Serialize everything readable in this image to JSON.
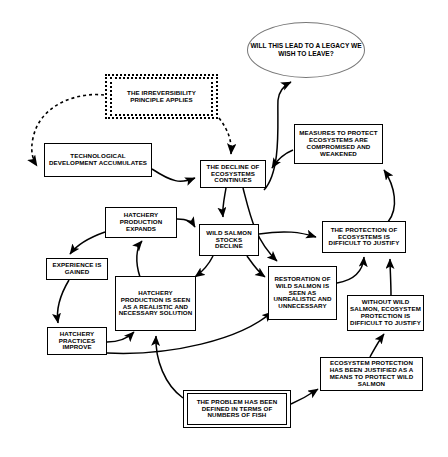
{
  "diagram": {
    "nodes": [
      {
        "id": "legacy",
        "label": "WILL THIS LEAD TO A LEGACY WE WISH TO LEAVE?",
        "shape": "ellipse"
      },
      {
        "id": "irreversibility",
        "label": "THE IRREVERSIBILITY PRINCIPLE APPLIES",
        "shape": "dashed-double-rect"
      },
      {
        "id": "technological",
        "label": "TECHNOLOGICAL DEVELOPMENT ACCUMULATES",
        "shape": "rect"
      },
      {
        "id": "decline",
        "label": "THE DECLINE OF ECOSYSTEMS CONTINUES",
        "shape": "rect"
      },
      {
        "id": "measures",
        "label": "MEASURES TO PROTECT ECOSYSTEMS ARE COMPROMISED AND WEAKENED",
        "shape": "rect"
      },
      {
        "id": "hatchery-expands",
        "label": "HATCHERY PRODUCTION EXPANDS",
        "shape": "rect"
      },
      {
        "id": "wild-salmon-decline",
        "label": "WILD SALMON STOCKS DECLINE",
        "shape": "rect"
      },
      {
        "id": "protection-difficult",
        "label": "THE PROTECTION OF ECOSYSTEMS IS DIFFICULT TO JUSTIFY",
        "shape": "rect"
      },
      {
        "id": "experience",
        "label": "EXPERIENCE IS GAINED",
        "shape": "rect"
      },
      {
        "id": "hatchery-solution",
        "label": "HATCHERY PRODUCTION IS SEEN AS A REALISTIC AND NECESSARY SOLUTION",
        "shape": "rect"
      },
      {
        "id": "restoration",
        "label": "RESTORATION OF WILD SALMON IS SEEN AS UNREALISTIC AND UNNECESSARY",
        "shape": "rect"
      },
      {
        "id": "without-wild",
        "label": "WITHOUT WILD SALMON, ECOSYSTEM PROTECTION IS DIFFICULT TO JUSTIFY",
        "shape": "rect"
      },
      {
        "id": "practices",
        "label": "HATCHERY PRACTICES IMPROVE",
        "shape": "rect"
      },
      {
        "id": "justified",
        "label": "ECOSYSTEM PROTECTION HAS BEEN JUSTIFIED AS A MEANS TO PROTECT WILD SALMON",
        "shape": "rect"
      },
      {
        "id": "problem",
        "label": "THE PROBLEM HAS BEEN DEFINED IN TERMS OF NUMBERS OF FISH",
        "shape": "double-rect"
      }
    ],
    "edges": [
      {
        "from": "irreversibility",
        "to": "technological",
        "style": "dashed"
      },
      {
        "from": "irreversibility",
        "to": "decline",
        "style": "dashed"
      },
      {
        "from": "technological",
        "to": "decline",
        "style": "solid"
      },
      {
        "from": "decline",
        "to": "wild-salmon-decline",
        "style": "solid"
      },
      {
        "from": "decline",
        "to": "restoration",
        "style": "solid"
      },
      {
        "from": "measures",
        "to": "decline",
        "style": "solid"
      },
      {
        "from": "decline",
        "to": "legacy",
        "style": "solid"
      },
      {
        "from": "protection-difficult",
        "to": "measures",
        "style": "solid"
      },
      {
        "from": "hatchery-expands",
        "to": "wild-salmon-decline",
        "style": "solid"
      },
      {
        "from": "hatchery-expands",
        "to": "experience",
        "style": "solid"
      },
      {
        "from": "experience",
        "to": "practices",
        "style": "solid"
      },
      {
        "from": "practices",
        "to": "hatchery-solution",
        "style": "solid"
      },
      {
        "from": "hatchery-solution",
        "to": "hatchery-expands",
        "style": "solid"
      },
      {
        "from": "wild-salmon-decline",
        "to": "hatchery-solution",
        "style": "solid"
      },
      {
        "from": "wild-salmon-decline",
        "to": "protection-difficult",
        "style": "solid"
      },
      {
        "from": "wild-salmon-decline",
        "to": "restoration",
        "style": "solid"
      },
      {
        "from": "restoration",
        "to": "protection-difficult",
        "style": "solid"
      },
      {
        "from": "without-wild",
        "to": "protection-difficult",
        "style": "solid"
      },
      {
        "from": "justified",
        "to": "without-wild",
        "style": "solid"
      },
      {
        "from": "problem",
        "to": "justified",
        "style": "solid"
      },
      {
        "from": "problem",
        "to": "hatchery-solution",
        "style": "solid"
      },
      {
        "from": "practices",
        "to": "restoration",
        "style": "solid"
      }
    ]
  }
}
